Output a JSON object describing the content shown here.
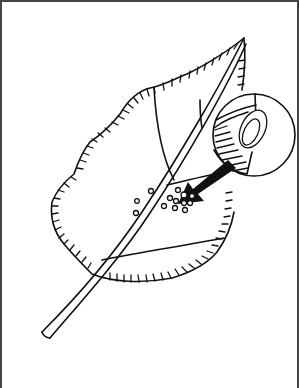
{
  "figure": {
    "elements": [
      {
        "name": "leaf-outline",
        "description": "serrated leaf blade with hatch marks along edge"
      },
      {
        "name": "leaf-midrib-stem",
        "description": "long double-line stem / midrib crossing leaf diagonally"
      },
      {
        "name": "magnifier-circle",
        "description": "circular inset showing enlarged egg on right side"
      },
      {
        "name": "magnified-egg",
        "description": "oval egg shape inside circle"
      },
      {
        "name": "pointer-arrow",
        "description": "thick black arrow pointing from circle to egg cluster"
      },
      {
        "name": "egg-cluster",
        "description": "small circles representing eggs on leaf surface"
      }
    ],
    "egg_count_cluster": 10,
    "egg_count_scattered": 3,
    "colors": {
      "line": "#111111",
      "background": "#ffffff",
      "border": "#444444"
    }
  }
}
